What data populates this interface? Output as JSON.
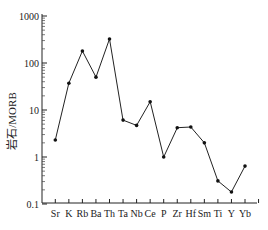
{
  "chart_data": {
    "type": "line",
    "title": "",
    "xlabel": "",
    "ylabel": "岩石/MORB",
    "yscale": "log",
    "ylim": [
      0.1,
      1000
    ],
    "yticks": [
      "0.1",
      "1",
      "10",
      "100",
      "1000"
    ],
    "grid": false,
    "legend": null,
    "categories": [
      "Sr",
      "K",
      "Rb",
      "Ba",
      "Th",
      "Ta",
      "Nb",
      "Ce",
      "P",
      "Zr",
      "Hf",
      "Sm",
      "Ti",
      "Y",
      "Yb"
    ],
    "series": [
      {
        "name": "样品",
        "values": [
          2.3,
          37,
          180,
          50,
          325,
          6.1,
          4.7,
          15,
          1.0,
          4.2,
          4.35,
          2.0,
          0.31,
          0.18,
          0.64
        ]
      }
    ]
  }
}
